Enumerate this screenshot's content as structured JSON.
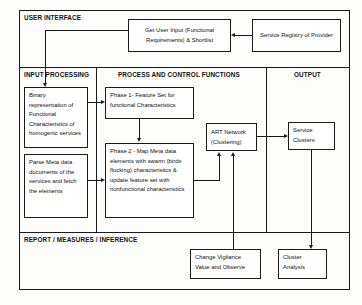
{
  "diagram": {
    "type": "block-flow-diagram",
    "panels": [
      {
        "id": "user-interface",
        "label": "USER INTERFACE"
      },
      {
        "id": "input-processing",
        "label": "INPUT PROCESSING"
      },
      {
        "id": "process-and-control",
        "label": "PROCESS AND CONTROL FUNCTIONS"
      },
      {
        "id": "output",
        "label": "OUTPUT"
      },
      {
        "id": "report-measures-inference",
        "label": "REPORT / MEASURES / INFERENCE"
      }
    ],
    "nodes": [
      {
        "id": "get-user-input",
        "text": "Get User Input (Functional Requirements) & Shortlist",
        "panel": "user-interface"
      },
      {
        "id": "service-registry",
        "text": "Service Registry of Provider",
        "panel": "user-interface"
      },
      {
        "id": "binary-representation",
        "text": "Binary representation of Functional Characteristics of homogenic services",
        "panel": "input-processing"
      },
      {
        "id": "parse-meta-data",
        "text": "Parse Meta data documents of the services and fetch the elements",
        "panel": "input-processing"
      },
      {
        "id": "phase-1",
        "text": "Phase 1- Feature Set for functional Characteristics",
        "panel": "process-and-control"
      },
      {
        "id": "phase-2",
        "text": "Phase 2 - Map Meta data elements with swarm (birds flocking) characteristics & update feature set with nonfunctional characteristics",
        "panel": "process-and-control"
      },
      {
        "id": "art-network",
        "text": "ART Network (Clustering)",
        "panel": "process-and-control"
      },
      {
        "id": "service-clusters",
        "text": "Service Clusters",
        "panel": "output"
      },
      {
        "id": "change-vigilance",
        "text": "Change Vigilance Value and Observe",
        "panel": "report-measures-inference"
      },
      {
        "id": "cluster-analysis",
        "text": "Cluster Analysis",
        "panel": "report-measures-inference"
      }
    ],
    "edges": [
      {
        "from": "service-registry",
        "to": "get-user-input",
        "direction": "left"
      },
      {
        "from": "get-user-input",
        "to": "binary-representation",
        "direction": "down"
      },
      {
        "from": "binary-representation",
        "to": "phase-1",
        "direction": "right"
      },
      {
        "from": "phase-1",
        "to": "phase-2",
        "direction": "down"
      },
      {
        "from": "parse-meta-data",
        "to": "phase-2",
        "direction": "right"
      },
      {
        "from": "phase-2",
        "to": "art-network",
        "direction": "up"
      },
      {
        "from": "art-network",
        "to": "service-clusters",
        "direction": "right"
      },
      {
        "from": "change-vigilance",
        "to": "art-network",
        "direction": "up"
      },
      {
        "from": "service-clusters",
        "to": "cluster-analysis",
        "direction": "down"
      }
    ],
    "colors": {
      "stroke": "#1a1a1a",
      "fill": "#ffffff",
      "background": "#fdfdfc"
    }
  }
}
